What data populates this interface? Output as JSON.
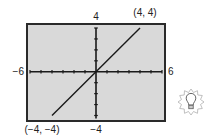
{
  "chart_data": {
    "type": "line",
    "title": "",
    "xlabel": "",
    "ylabel": "",
    "xlim": [
      -6,
      6
    ],
    "ylim": [
      -4,
      4
    ],
    "x_tick_step": 1,
    "y_tick_step": 1,
    "grid": false,
    "series": [
      {
        "name": "y = x",
        "x": [
          -4,
          4
        ],
        "y": [
          -4,
          4
        ]
      }
    ],
    "axis_end_labels": {
      "x_min": "−6",
      "x_max": "6",
      "y_max": "4",
      "y_min": "−4"
    },
    "annotations": [
      {
        "text": "(4, 4)",
        "x": 4,
        "y": 4,
        "position": "above"
      },
      {
        "text": "(−4, −4)",
        "x": -4,
        "y": -4,
        "position": "below"
      }
    ],
    "colors": {
      "plot_background": "#d9d9d9",
      "frame": "#2a2a2a",
      "axes": "#1a1a1a",
      "line": "#1a1a1a"
    }
  },
  "icon": {
    "name": "lightbulb-icon"
  }
}
